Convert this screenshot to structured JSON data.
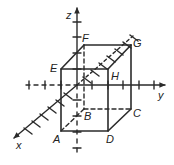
{
  "diagram": {
    "type": "3d-coordinate-prism",
    "axes": {
      "x": "x",
      "y": "y",
      "z": "z"
    },
    "vertices": {
      "A": "A",
      "B": "B",
      "C": "C",
      "D": "D",
      "E": "E",
      "F": "F",
      "G": "G",
      "H": "H"
    },
    "colors": {
      "line": "#2b2b2b",
      "background": "#ffffff"
    }
  }
}
